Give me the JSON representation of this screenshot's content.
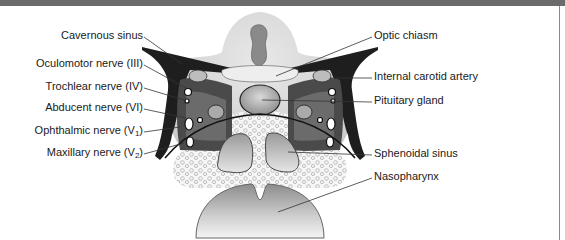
{
  "figure": {
    "labels_left": [
      {
        "id": "cavernous-sinus",
        "text": "Cavernous sinus",
        "sub": ""
      },
      {
        "id": "oculomotor-nerve",
        "text": "Oculomotor nerve (III)",
        "sub": ""
      },
      {
        "id": "trochlear-nerve",
        "text": "Trochlear nerve (IV)",
        "sub": ""
      },
      {
        "id": "abducent-nerve",
        "text": "Abducent nerve (VI)",
        "sub": ""
      },
      {
        "id": "ophthalmic-nerve",
        "text": "Ophthalmic nerve (V",
        "sub": "1",
        "suffix": ")"
      },
      {
        "id": "maxillary-nerve",
        "text": "Maxillary nerve (V",
        "sub": "2",
        "suffix": ")"
      }
    ],
    "labels_right": [
      {
        "id": "optic-chiasm",
        "text": "Optic chiasm"
      },
      {
        "id": "internal-carotid-artery",
        "text": "Internal carotid artery"
      },
      {
        "id": "pituitary-gland",
        "text": "Pituitary gland"
      },
      {
        "id": "sphenoidal-sinus",
        "text": "Sphenoidal sinus"
      },
      {
        "id": "nasopharynx",
        "text": "Nasopharynx"
      }
    ],
    "colors": {
      "frame_bar": "#6b6b6b",
      "label_text": "#1a1a1a",
      "leader_line": "#333333",
      "dura_dark": "#1e1e1e",
      "brain_gray": "#d6d6d6",
      "sinus_dark": "#3a3a3a"
    }
  }
}
